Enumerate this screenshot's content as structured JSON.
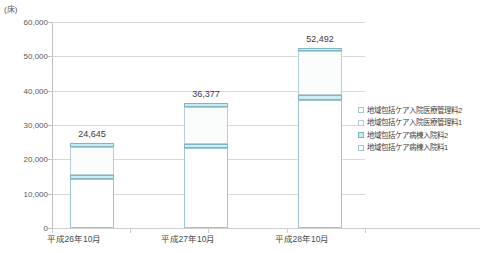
{
  "unit_label": "(床)",
  "chart_data": {
    "type": "bar",
    "stacked": true,
    "title": "",
    "xlabel": "",
    "ylabel": "(床)",
    "ylim": [
      0,
      60000
    ],
    "ytick_step": 10000,
    "grid": true,
    "legend_position": "right",
    "categories": [
      "平成26年10月",
      "平成27年10月",
      "平成28年10月"
    ],
    "yticks": [
      "0",
      "10,000",
      "20,000",
      "30,000",
      "40,000",
      "50,000",
      "60,000"
    ],
    "totals": [
      "24,645",
      "36,377",
      "52,492"
    ],
    "total_values": [
      24645,
      36377,
      52492
    ],
    "series": [
      {
        "name": "地域包括ケア病棟入院料1",
        "color": "#ffffff",
        "values": [
          14400,
          23400,
          37200
        ]
      },
      {
        "name": "地域包括ケア病棟入院料2",
        "color": "#c9ecf2",
        "values": [
          900,
          1100,
          1500
        ]
      },
      {
        "name": "地域包括ケア入院医療管理料1",
        "color": "#fbfdfd",
        "values": [
          8345,
          10877,
          12792
        ]
      },
      {
        "name": "地域包括ケア入院医療管理料2",
        "color": "#cdeef2",
        "values": [
          1000,
          1000,
          1000
        ]
      }
    ],
    "legend_entries": [
      "地域包括ケア入院医療管理料2",
      "地域包括ケア入院医療管理料1",
      "地域包括ケア病棟入院料2",
      "地域包括ケア病棟入院料1"
    ]
  }
}
